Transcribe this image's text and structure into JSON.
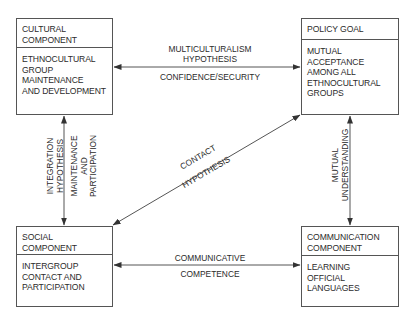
{
  "colors": {
    "line": "#555555",
    "text": "#2b2b2b",
    "background": "#ffffff"
  },
  "boxes": {
    "cultural": {
      "title": "CULTURAL\nCOMPONENT",
      "body": "ETHNOCULTURAL\nGROUP\nMAINTENANCE\nAND DEVELOPMENT"
    },
    "policy": {
      "title": "POLICY GOAL",
      "body": "MUTUAL\nACCEPTANCE\nAMONG ALL\nETHNOCULTURAL\nGROUPS"
    },
    "social": {
      "title": "SOCIAL\nCOMPONENT",
      "body": "INTERGROUP\nCONTACT AND\nPARTICIPATION"
    },
    "communication": {
      "title": "COMMUNICATION\nCOMPONENT",
      "body": "LEARNING\nOFFICIAL\nLANGUAGES"
    }
  },
  "links": {
    "cultural_policy": {
      "above": "MULTICULTURALISM\nHYPOTHESIS",
      "below": "CONFIDENCE/SECURITY",
      "direction": "bidirectional"
    },
    "cultural_social": {
      "left": "INTEGRATION\nHYPOTHESIS",
      "right": "MAINTENANCE\nAND PARTICIPATION",
      "direction": "bidirectional"
    },
    "social_policy": {
      "above": "CONTACT",
      "below": "HYPOTHESIS",
      "direction": "bidirectional"
    },
    "policy_communication": {
      "left": "MUTUAL",
      "right": "UNDERSTANDING",
      "direction": "bidirectional"
    },
    "social_communication": {
      "above": "COMMUNICATIVE",
      "below": "COMPETENCE",
      "direction": "bidirectional"
    }
  }
}
